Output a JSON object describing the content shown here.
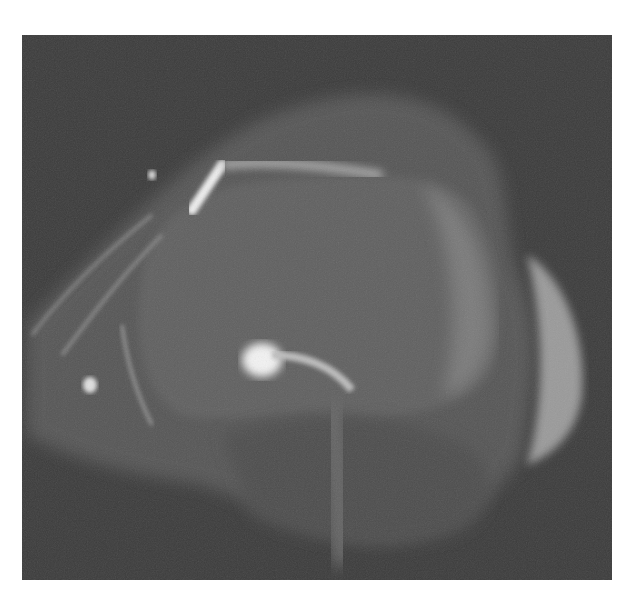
{
  "image": {
    "type": "MRI scan (grayscale)",
    "background_color": "#ffffff",
    "scan_background_color": "#3c3c3c",
    "frame": {
      "x": 22,
      "y": 35,
      "width": 590,
      "height": 545
    }
  }
}
